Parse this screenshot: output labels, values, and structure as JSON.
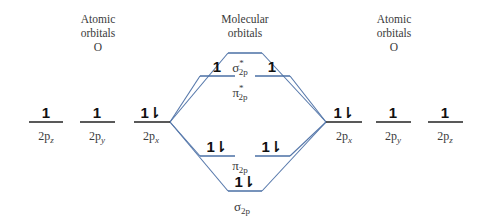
{
  "headers": {
    "left": {
      "line1": "Atomic",
      "line2": "orbitals",
      "line3": "O"
    },
    "center": {
      "line1": "Molecular",
      "line2": "orbitals"
    },
    "right": {
      "line1": "Atomic",
      "line2": "orbitals",
      "line3": "O"
    }
  },
  "atomic_orbitals_left": [
    {
      "label": "2p",
      "sub": "z",
      "electrons": "1"
    },
    {
      "label": "2p",
      "sub": "y",
      "electrons": "1"
    },
    {
      "label": "2p",
      "sub": "x",
      "electrons": "1⇂"
    }
  ],
  "atomic_orbitals_right": [
    {
      "label": "2p",
      "sub": "x",
      "electrons": "1⇂"
    },
    {
      "label": "2p",
      "sub": "y",
      "electrons": "1"
    },
    {
      "label": "2p",
      "sub": "z",
      "electrons": "1"
    }
  ],
  "molecular_orbitals": {
    "sigma_star": {
      "symbol": "σ",
      "sup": "*",
      "sub": "2p",
      "electrons": ""
    },
    "pi_star": {
      "symbol": "π",
      "sup": "*",
      "sub": "2p",
      "electrons_left": "1",
      "electrons_right": "1"
    },
    "pi": {
      "symbol": "π",
      "sub": "2p",
      "electrons_left": "1⇂",
      "electrons_right": "1⇂"
    },
    "sigma": {
      "symbol": "σ",
      "sub": "2p",
      "electrons": "1⇂"
    }
  },
  "colors": {
    "mo_line": "#4a6fa5",
    "ao_line": "#222222",
    "connector": "#5577aa"
  }
}
